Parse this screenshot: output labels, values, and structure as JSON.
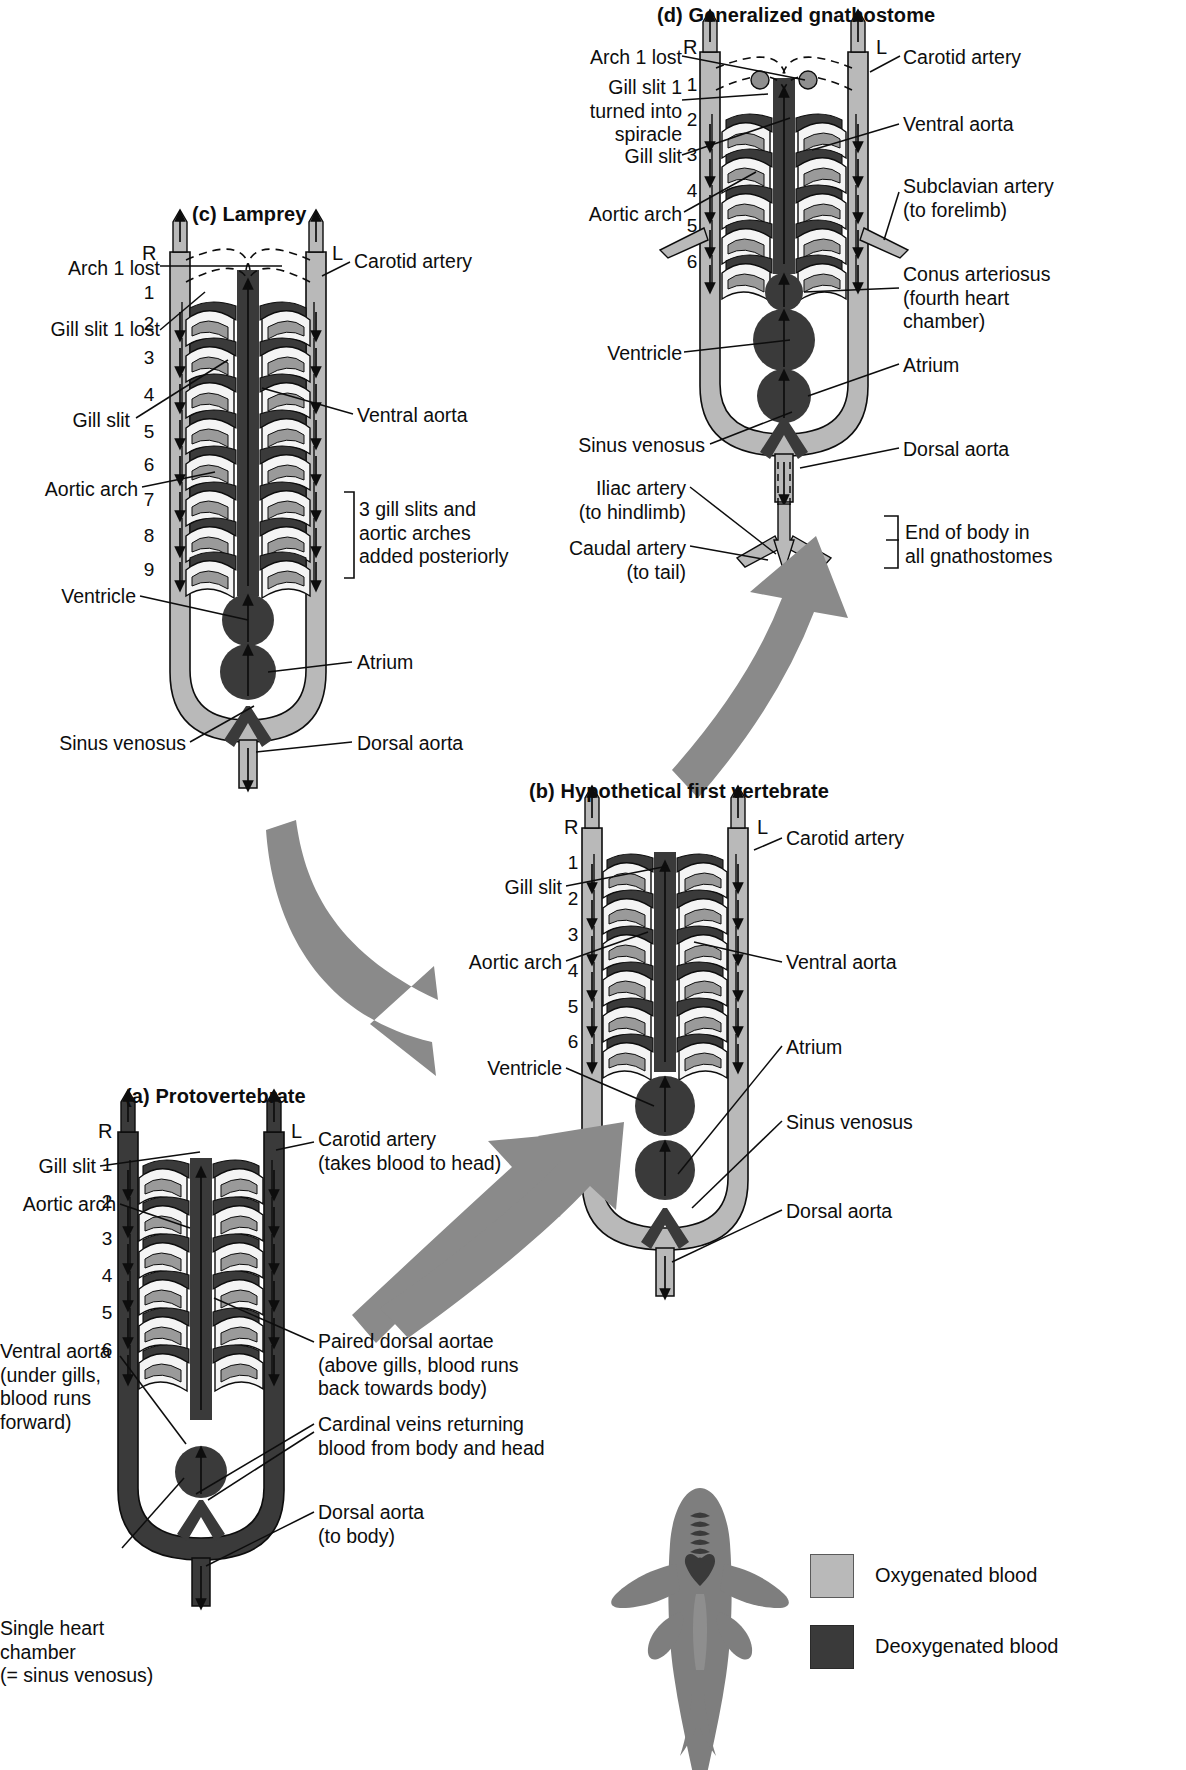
{
  "figure": {
    "title_hidden": "Evolution of the vertebrate aortic arches and heart",
    "colors": {
      "oxygenated": "#b9b9b9",
      "deoxygenated": "#3a3a3a",
      "outline": "#0d0d0d",
      "arrow_big": "#8a8a8a",
      "background": "#ffffff",
      "gill_lamella": "#9a9a9a",
      "gill_cavity": "#f4f4f4"
    }
  },
  "panels": {
    "a": {
      "title": "(a) Protovertebrate",
      "side_right": "R",
      "side_left": "L",
      "arch_numbers": [
        "1",
        "2",
        "3",
        "4",
        "5",
        "6"
      ],
      "labels": {
        "gill_slit": "Gill slit",
        "aortic_arch": "Aortic arch",
        "carotid_artery": "Carotid artery\n(takes blood to head)",
        "ventral_aorta": "Ventral aorta\n(under gills,\nblood runs\nforward)",
        "paired_dorsal_aortae": "Paired dorsal aortae\n(above gills, blood runs\nback towards body)",
        "cardinal_veins": "Cardinal veins returning\nblood from body and head",
        "single_heart_chamber": "Single heart\nchamber\n(= sinus venosus)",
        "dorsal_aorta": "Dorsal aorta\n(to body)"
      }
    },
    "b": {
      "title": "(b) Hypothetical first vertebrate",
      "side_right": "R",
      "side_left": "L",
      "arch_numbers": [
        "1",
        "2",
        "3",
        "4",
        "5",
        "6"
      ],
      "labels": {
        "gill_slit": "Gill slit",
        "aortic_arch": "Aortic arch",
        "carotid_artery": "Carotid artery",
        "ventral_aorta": "Ventral aorta",
        "ventricle": "Ventricle",
        "atrium": "Atrium",
        "sinus_venosus": "Sinus venosus",
        "dorsal_aorta": "Dorsal aorta"
      }
    },
    "c": {
      "title": "(c) Lamprey",
      "side_right": "R",
      "side_left": "L",
      "arch_numbers": [
        "1",
        "2",
        "3",
        "4",
        "5",
        "6",
        "7",
        "8",
        "9"
      ],
      "labels": {
        "arch_1_lost": "Arch 1 lost",
        "gill_slit_1_lost": "Gill slit 1 lost",
        "gill_slit": "Gill slit",
        "aortic_arch": "Aortic arch",
        "carotid_artery": "Carotid artery",
        "ventral_aorta": "Ventral aorta",
        "added_posteriorly": "3 gill slits and\naortic arches\nadded posteriorly",
        "ventricle": "Ventricle",
        "atrium": "Atrium",
        "sinus_venosus": "Sinus venosus",
        "dorsal_aorta": "Dorsal aorta"
      }
    },
    "d": {
      "title": "(d) Generalized gnathostome",
      "side_right": "R",
      "side_left": "L",
      "arch_numbers": [
        "1",
        "2",
        "3",
        "4",
        "5",
        "6"
      ],
      "labels": {
        "arch_1_lost": "Arch 1 lost",
        "spiracle": "Gill slit 1\nturned into\nspiracle",
        "gill_slit": "Gill slit",
        "aortic_arch": "Aortic arch",
        "carotid_artery": "Carotid artery",
        "ventral_aorta": "Ventral aorta",
        "subclavian_artery": "Subclavian artery\n(to forelimb)",
        "conus_arteriosus": "Conus arteriosus\n(fourth heart\nchamber)",
        "ventricle": "Ventricle",
        "atrium": "Atrium",
        "sinus_venosus": "Sinus venosus",
        "dorsal_aorta": "Dorsal aorta",
        "iliac_artery": "Iliac artery\n(to hindlimb)",
        "caudal_artery": "Caudal artery\n(to tail)",
        "end_of_body": "End of body in\nall gnathostomes"
      }
    }
  },
  "legend": {
    "items": [
      {
        "swatch_color": "#b9b9b9",
        "label": "Oxygenated blood"
      },
      {
        "swatch_color": "#3a3a3a",
        "label": "Deoxygenated blood"
      }
    ]
  },
  "fish_inset": {
    "name": "shark-dorsal-view",
    "body_color": "#7e7e7e",
    "marks": [
      "gill-arches",
      "heart"
    ]
  }
}
